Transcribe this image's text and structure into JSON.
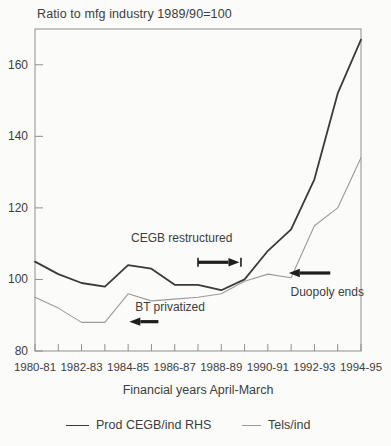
{
  "page": {
    "background": "#fbfbf9",
    "text_color": "#3d3d3d",
    "frame_color": "#8f8f8f",
    "arrow_color": "#1e1e1e"
  },
  "chart_data": {
    "type": "line",
    "title": "Ratio to mfg industry 1989/90=100",
    "xlabel": "Financial years April-March",
    "ylabel": "",
    "categories": [
      "1980-81",
      "1981-82",
      "1982-83",
      "1983-84",
      "1984-85",
      "1985-86",
      "1986-87",
      "1987-88",
      "1988-89",
      "1989-90",
      "1990-91",
      "1991-92",
      "1992-93",
      "1993-94",
      "1994-95"
    ],
    "x_tick_labels": [
      "1980-81",
      "1982-83",
      "1984-85",
      "1986-87",
      "1988-89",
      "1990-91",
      "1992-93",
      "1994-95"
    ],
    "x_label_every": 2,
    "ylim": [
      80,
      170
    ],
    "yticks": [
      80,
      100,
      120,
      140,
      160
    ],
    "grid": false,
    "legend_position": "bottom",
    "series": [
      {
        "name": "Prod CEGB/ind RHS",
        "color": "#3a3a3a",
        "stroke_width": 1.8,
        "values": [
          105,
          101.5,
          99,
          98,
          104,
          103,
          98.5,
          98.5,
          97,
          100,
          108,
          114,
          128,
          152,
          167
        ]
      },
      {
        "name": "Tels/ind",
        "color": "#9b9b9b",
        "stroke_width": 1.1,
        "values": [
          95,
          92,
          88,
          88,
          96,
          94,
          94.5,
          95,
          96,
          99.5,
          101.5,
          100.5,
          115,
          120,
          134
        ]
      }
    ],
    "annotations": [
      {
        "text": "CEGB restructured",
        "x": 6.3,
        "y": 111.5,
        "arrow": {
          "dir": "right",
          "x_from": 7.0,
          "x_to": 8.78,
          "y": 104.8,
          "end_caps": true
        }
      },
      {
        "text": "BT privatized",
        "x": 5.8,
        "y": 92.4,
        "arrow": {
          "dir": "left",
          "x_from": 5.3,
          "x_to": 4.05,
          "y": 88.2,
          "end_caps": false
        }
      },
      {
        "text": "Duopoly ends",
        "x": 12.55,
        "y": 96.6,
        "arrow": {
          "dir": "left",
          "x_from": 12.68,
          "x_to": 10.9,
          "y": 101.8,
          "end_caps": false
        }
      }
    ]
  }
}
